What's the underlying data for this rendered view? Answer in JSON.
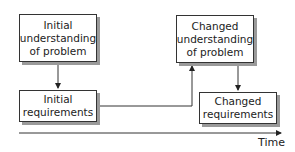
{
  "diagram": {
    "boxes": [
      {
        "id": "initial-understanding",
        "lines": [
          "Initial",
          "understanding",
          "of problem"
        ]
      },
      {
        "id": "initial-requirements",
        "lines": [
          "Initial",
          "requirements"
        ]
      },
      {
        "id": "changed-understanding",
        "lines": [
          "Changed",
          "understanding",
          "of problem"
        ]
      },
      {
        "id": "changed-requirements",
        "lines": [
          "Changed",
          "requirements"
        ]
      }
    ],
    "edges": [
      {
        "from": "initial-understanding",
        "to": "initial-requirements"
      },
      {
        "from": "initial-requirements",
        "to": "changed-understanding"
      },
      {
        "from": "changed-understanding",
        "to": "changed-requirements"
      }
    ],
    "axis": {
      "label": "Time"
    },
    "colors": {
      "line": "#333333",
      "shadow": "#9a9a9a",
      "background": "#ffffff"
    }
  }
}
